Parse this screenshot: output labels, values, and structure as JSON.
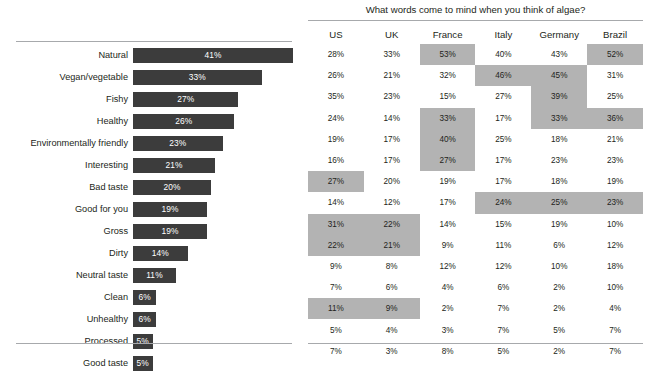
{
  "chart_data": [
    {
      "type": "bar",
      "title": "",
      "xlabel": "",
      "ylabel": "",
      "orientation": "horizontal",
      "grid": false,
      "legend": "none",
      "xlim": [
        0,
        41
      ],
      "categories": [
        "Natural",
        "Vegan/vegetable",
        "Fishy",
        "Healthy",
        "Environmentally friendly",
        "Interesting",
        "Bad taste",
        "Good for you",
        "Gross",
        "Dirty",
        "Neutral taste",
        "Clean",
        "Unhealthy",
        "Processed",
        "Good taste"
      ],
      "values": [
        41,
        33,
        27,
        26,
        23,
        21,
        20,
        19,
        19,
        14,
        11,
        6,
        6,
        5,
        5
      ],
      "value_labels": [
        "41%",
        "33%",
        "27%",
        "26%",
        "23%",
        "21%",
        "20%",
        "19%",
        "19%",
        "14%",
        "11%",
        "6%",
        "6%",
        "5%",
        "5%"
      ],
      "bar_color": "#3c3c3c",
      "label_color": "#ffffff"
    },
    {
      "type": "table",
      "title": "What words come to mind when you think of algae?",
      "columns": [
        "US",
        "UK",
        "France",
        "Italy",
        "Germany",
        "Brazil"
      ],
      "rows": [
        {
          "label": "Natural",
          "values": [
            "28%",
            "33%",
            "53%",
            "40%",
            "43%",
            "52%"
          ],
          "highlight": [
            false,
            false,
            true,
            false,
            false,
            true
          ]
        },
        {
          "label": "Vegan/vegetable",
          "values": [
            "26%",
            "21%",
            "32%",
            "46%",
            "45%",
            "31%"
          ],
          "highlight": [
            false,
            false,
            false,
            true,
            true,
            false
          ]
        },
        {
          "label": "Fishy",
          "values": [
            "35%",
            "23%",
            "15%",
            "27%",
            "39%",
            "25%"
          ],
          "highlight": [
            false,
            false,
            false,
            false,
            true,
            false
          ]
        },
        {
          "label": "Healthy",
          "values": [
            "24%",
            "14%",
            "33%",
            "17%",
            "33%",
            "36%"
          ],
          "highlight": [
            false,
            false,
            true,
            false,
            true,
            true
          ]
        },
        {
          "label": "Environmentally friendly",
          "values": [
            "19%",
            "17%",
            "40%",
            "25%",
            "18%",
            "21%"
          ],
          "highlight": [
            false,
            false,
            true,
            false,
            false,
            false
          ]
        },
        {
          "label": "Interesting",
          "values": [
            "16%",
            "17%",
            "27%",
            "17%",
            "23%",
            "23%"
          ],
          "highlight": [
            false,
            false,
            true,
            false,
            false,
            false
          ]
        },
        {
          "label": "Bad taste",
          "values": [
            "27%",
            "20%",
            "19%",
            "17%",
            "18%",
            "19%"
          ],
          "highlight": [
            true,
            false,
            false,
            false,
            false,
            false
          ]
        },
        {
          "label": "Good for you",
          "values": [
            "14%",
            "12%",
            "17%",
            "24%",
            "25%",
            "23%"
          ],
          "highlight": [
            false,
            false,
            false,
            true,
            true,
            true
          ]
        },
        {
          "label": "Gross",
          "values": [
            "31%",
            "22%",
            "14%",
            "15%",
            "19%",
            "10%"
          ],
          "highlight": [
            true,
            true,
            false,
            false,
            false,
            false
          ]
        },
        {
          "label": "Dirty",
          "values": [
            "22%",
            "21%",
            "9%",
            "11%",
            "6%",
            "12%"
          ],
          "highlight": [
            true,
            true,
            false,
            false,
            false,
            false
          ]
        },
        {
          "label": "Neutral taste",
          "values": [
            "9%",
            "8%",
            "12%",
            "12%",
            "10%",
            "18%"
          ],
          "highlight": [
            false,
            false,
            false,
            false,
            false,
            false
          ]
        },
        {
          "label": "Clean",
          "values": [
            "7%",
            "6%",
            "4%",
            "6%",
            "2%",
            "10%"
          ],
          "highlight": [
            false,
            false,
            false,
            false,
            false,
            false
          ]
        },
        {
          "label": "Unhealthy",
          "values": [
            "11%",
            "9%",
            "2%",
            "7%",
            "2%",
            "4%"
          ],
          "highlight": [
            true,
            true,
            false,
            false,
            false,
            false
          ]
        },
        {
          "label": "Processed",
          "values": [
            "5%",
            "4%",
            "3%",
            "7%",
            "5%",
            "7%"
          ],
          "highlight": [
            false,
            false,
            false,
            false,
            false,
            false
          ]
        },
        {
          "label": "Good taste",
          "values": [
            "7%",
            "3%",
            "8%",
            "5%",
            "2%",
            "7%"
          ],
          "highlight": [
            false,
            false,
            false,
            false,
            false,
            false
          ]
        }
      ],
      "highlight_color": "#b3b3b3"
    }
  ]
}
